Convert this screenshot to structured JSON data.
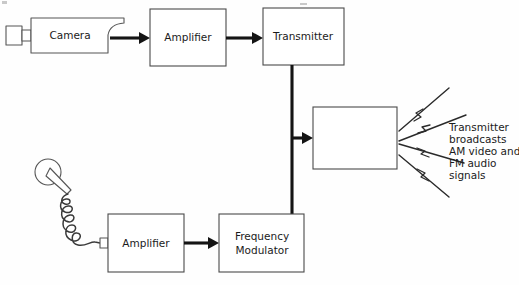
{
  "diagram": {
    "video_chain": {
      "source": {
        "name": "camera",
        "label": "Camera"
      },
      "amplifier": {
        "label": "Amplifier"
      },
      "transmitter": {
        "label": "Transmitter"
      }
    },
    "audio_chain": {
      "source": {
        "name": "microphone",
        "label": ""
      },
      "amplifier": {
        "label": "Amplifier"
      },
      "modulator": {
        "label_line_1": "Frequency",
        "label_line_2": "Modulator"
      }
    },
    "antenna": {
      "label": ""
    },
    "broadcast_caption": {
      "lines": [
        "Transmitter",
        "broadcasts",
        "AM video and",
        "FM audio",
        "signals"
      ]
    },
    "colors": {
      "ink": "#1b1b1b",
      "box_stroke": "#4a4a4a",
      "flow_stroke": "#141414",
      "background": "#fefefe"
    }
  }
}
